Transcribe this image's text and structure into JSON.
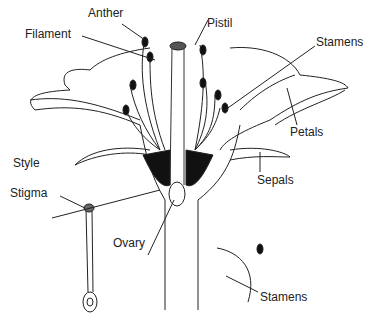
{
  "diagram": {
    "type": "flower-anatomy",
    "labels": {
      "anther": "Anther",
      "filament": "Filament",
      "pistil": "Pistil",
      "stamens_top": "Stamens",
      "petals": "Petals",
      "style": "Style",
      "sepals": "Sepals",
      "stigma": "Stigma",
      "ovary": "Ovary",
      "stamens_bottom": "Stamens"
    }
  }
}
